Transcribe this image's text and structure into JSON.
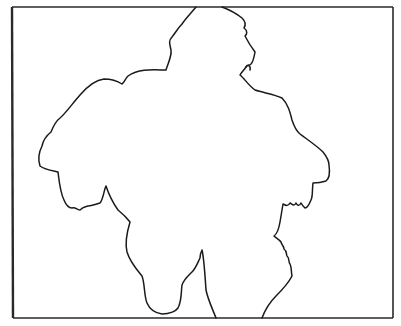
{
  "drawing": {
    "subject": "line-drawing silhouette outline of a figure inside a rectangular frame",
    "background_color": "#ffffff",
    "line_color": "#1a1a1a",
    "frame": {
      "left": 12,
      "top": 7,
      "right": 393,
      "bottom": 318
    }
  }
}
